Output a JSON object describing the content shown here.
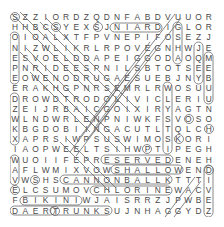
{
  "puzzle": {
    "type": "word-search",
    "rows": 20,
    "cols": 20,
    "grid": [
      "SZZIORDZQDNFABDVUUOR",
      "HHBCSYEXSJNIARDIGLOR",
      "OIOALXTFPVNEPIFOSEZJ",
      "NIZWLIKRLRPOVEGNHWJE",
      "ESVOELDDAPEIGGODAOQM",
      "PNRIDEESPNILSBTOTSEE",
      "EOWENODRUGAESUEBJNYB",
      "ERAKHGPNRSEMRLRWOSUU",
      "DROWDTRODOLIVICLERIU",
      "ZEIJRBAICGOIXIRYAGTN",
      "WLNDWRLENPNIWKFSVOSO",
      "KBGDOBIINGACUTLTQLCH",
      "XAPRSIWPSUSWIMOSKORI",
      "IAOPWEELTSIHWPTIPEGH",
      "WUOIIFEPRESERVEDENEH",
      "AFLWMIXVOWSHALLOWEND",
      "VWSHSCANNONBALLKTTTI",
      "ELCSUMOVCHLORINEWACV",
      "FBIKINIWJAISRRZJPWBE",
      "DAERTRUNKSUJNHAGGYDZ"
    ],
    "found_words_visible": [
      "NIARD",
      "SERVED",
      "SHALLOW",
      "CANNONBALL",
      "CHLORINE",
      "BIKINI",
      "TRUNKS"
    ]
  }
}
